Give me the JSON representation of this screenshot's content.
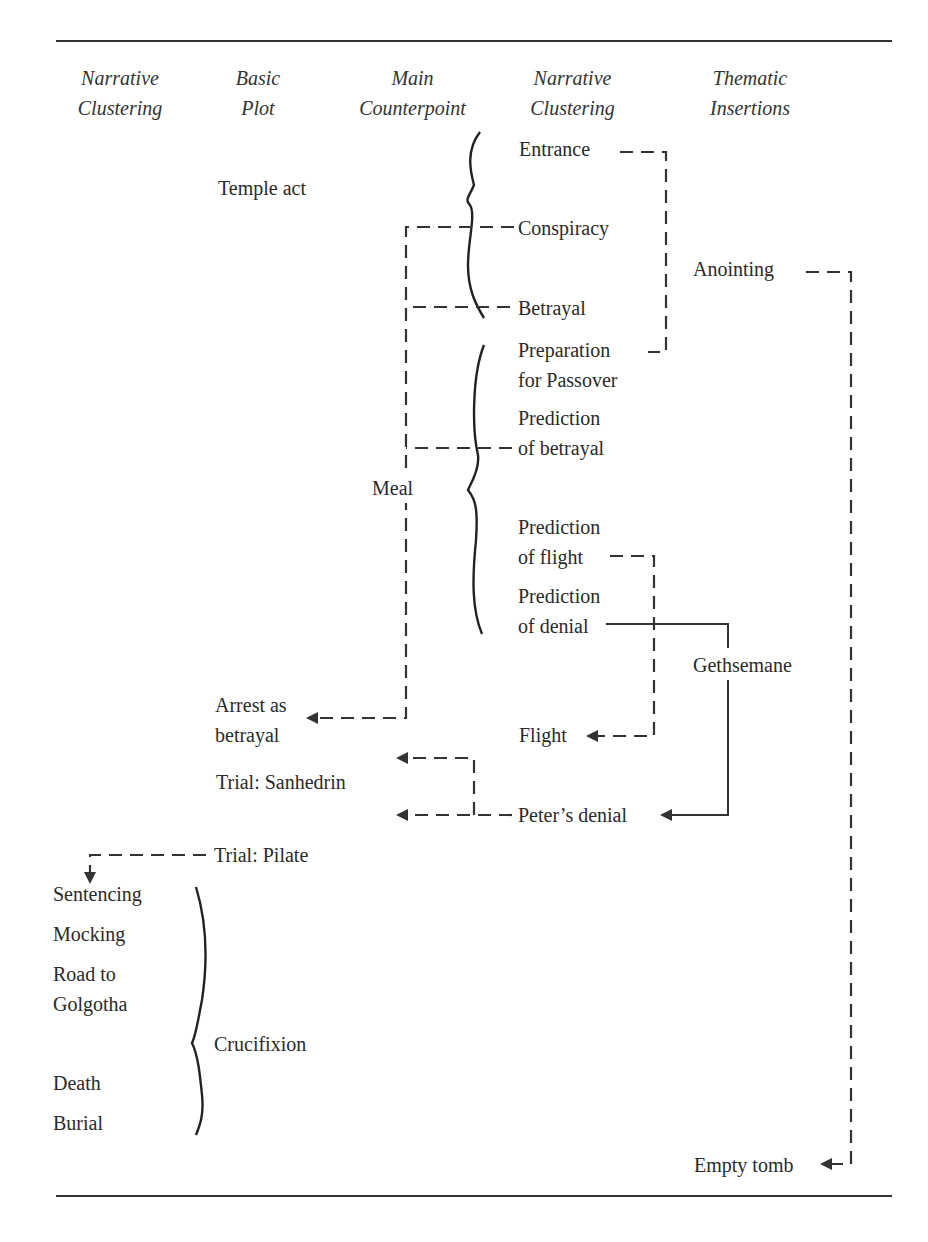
{
  "headers": [
    {
      "line1": "Narrative",
      "line2": "Clustering"
    },
    {
      "line1": "Basic",
      "line2": "Plot"
    },
    {
      "line1": "Main",
      "line2": "Counterpoint"
    },
    {
      "line1": "Narrative",
      "line2": "Clustering"
    },
    {
      "line1": "Thematic",
      "line2": "Insertions"
    }
  ],
  "basic_plot": {
    "temple_act": "Temple act",
    "meal": "Meal",
    "arrest_line1": "Arrest as",
    "arrest_line2": "betrayal",
    "trial_sanhedrin": "Trial: Sanhedrin",
    "trial_pilate": "Trial: Pilate",
    "crucifixion": "Crucifixion"
  },
  "narrative_clustering_right": {
    "entrance": "Entrance",
    "conspiracy": "Conspiracy",
    "betrayal": "Betrayal",
    "preparation_line1": "Preparation",
    "preparation_line2": "for Passover",
    "prediction_betrayal_line1": "Prediction",
    "prediction_betrayal_line2": "of betrayal",
    "prediction_flight_line1": "Prediction",
    "prediction_flight_line2": "of flight",
    "prediction_denial_line1": "Prediction",
    "prediction_denial_line2": "of denial",
    "flight": "Flight",
    "peters_denial": "Peter’s denial"
  },
  "thematic_insertions": {
    "anointing": "Anointing",
    "gethsemane": "Gethsemane",
    "empty_tomb": "Empty tomb"
  },
  "narrative_clustering_left": {
    "sentencing": "Sentencing",
    "mocking": "Mocking",
    "road_line1": "Road to",
    "road_line2": "Golgotha",
    "death": "Death",
    "burial": "Burial"
  }
}
